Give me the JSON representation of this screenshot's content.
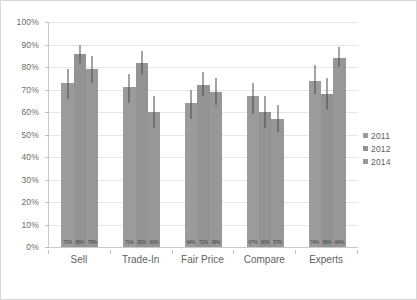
{
  "chart_data": {
    "type": "bar",
    "title": "",
    "subtitle": "",
    "xlabel": "",
    "ylabel": "",
    "categories": [
      "Sell",
      "Trade-In",
      "Fair Price",
      "Compare",
      "Experts"
    ],
    "series": [
      {
        "name": "2011",
        "color": "#9b9b9b",
        "values": [
          73,
          71,
          64,
          67,
          74
        ],
        "labels": [
          "73%",
          "71%",
          "64%",
          "67%",
          "74%"
        ],
        "error_low": [
          66,
          64,
          57,
          59,
          68
        ],
        "error_high": [
          79,
          77,
          70,
          73,
          81
        ]
      },
      {
        "name": "2012",
        "color": "#939393",
        "values": [
          86,
          82,
          72,
          60,
          68
        ],
        "labels": [
          "86%",
          "82%",
          "72%",
          "60%",
          "68%"
        ],
        "error_low": [
          82,
          77,
          67,
          53,
          61
        ],
        "error_high": [
          90,
          87,
          78,
          67,
          75
        ]
      },
      {
        "name": "2014",
        "color": "#979797",
        "values": [
          79,
          60,
          69,
          57,
          84
        ],
        "labels": [
          "79%",
          "60%",
          "69%",
          "57%",
          "84%"
        ],
        "error_low": [
          73,
          53,
          63,
          51,
          80
        ],
        "error_high": [
          85,
          67,
          75,
          63,
          89
        ]
      }
    ],
    "ylim": [
      0,
      100
    ],
    "ytick_step": 10,
    "ytick_labels": [
      "100%",
      "90%",
      "80%",
      "70%",
      "60%",
      "50%",
      "40%",
      "30%",
      "20%",
      "10%",
      "0%"
    ],
    "grid": true,
    "legend": {
      "position": "right",
      "entries": [
        "2011",
        "2012",
        "2014"
      ]
    },
    "error_bars": true,
    "data_labels_position": "base"
  }
}
